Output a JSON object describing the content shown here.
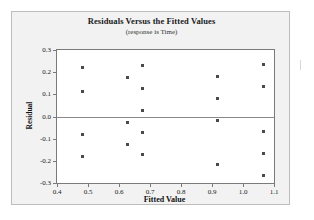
{
  "chart_data": {
    "type": "scatter",
    "title": "Residuals Versus the Fitted Values",
    "subtitle": "(response is Time)",
    "xlabel": "Fitted Value",
    "ylabel": "Residual",
    "xlim": [
      0.4,
      1.1
    ],
    "ylim": [
      -0.3,
      0.3
    ],
    "xticks": [
      0.4,
      0.5,
      0.6,
      0.7,
      0.8,
      0.9,
      1.0,
      1.1
    ],
    "xtick_labels": [
      "0.4",
      "0.5",
      "0.6",
      "0.7",
      "0.8",
      "0.9",
      "1.0",
      "1.1"
    ],
    "yticks": [
      0.3,
      0.2,
      0.1,
      0.0,
      -0.1,
      -0.2,
      -0.3
    ],
    "ytick_labels": [
      "0.3",
      "0.2",
      "0.1",
      "0.0",
      "-0.1",
      "-0.2",
      "-0.3"
    ],
    "grid": false,
    "legend": false,
    "reference_line": {
      "axis": "y",
      "value": 0.0,
      "color": "#8a8a8a"
    },
    "marker": {
      "shape": "square",
      "color": "#4a4a4a",
      "size": 3
    },
    "points": [
      {
        "x": 0.481,
        "y": 0.222
      },
      {
        "x": 0.481,
        "y": 0.114
      },
      {
        "x": 0.481,
        "y": -0.08
      },
      {
        "x": 0.481,
        "y": -0.179
      },
      {
        "x": 0.628,
        "y": 0.176
      },
      {
        "x": 0.628,
        "y": -0.026
      },
      {
        "x": 0.628,
        "y": -0.126
      },
      {
        "x": 0.675,
        "y": 0.231
      },
      {
        "x": 0.675,
        "y": 0.127
      },
      {
        "x": 0.675,
        "y": 0.028
      },
      {
        "x": 0.675,
        "y": -0.074
      },
      {
        "x": 0.675,
        "y": -0.172
      },
      {
        "x": 0.919,
        "y": 0.179
      },
      {
        "x": 0.919,
        "y": 0.082
      },
      {
        "x": 0.919,
        "y": -0.017
      },
      {
        "x": 0.919,
        "y": -0.216
      },
      {
        "x": 1.066,
        "y": 0.235
      },
      {
        "x": 1.066,
        "y": 0.134
      },
      {
        "x": 1.066,
        "y": -0.066
      },
      {
        "x": 1.066,
        "y": -0.165
      },
      {
        "x": 1.066,
        "y": -0.264
      }
    ]
  },
  "figure": {
    "background": "#f2f2f2",
    "plot_background": "#ffffff",
    "frame_color": "#7a7a7a"
  }
}
